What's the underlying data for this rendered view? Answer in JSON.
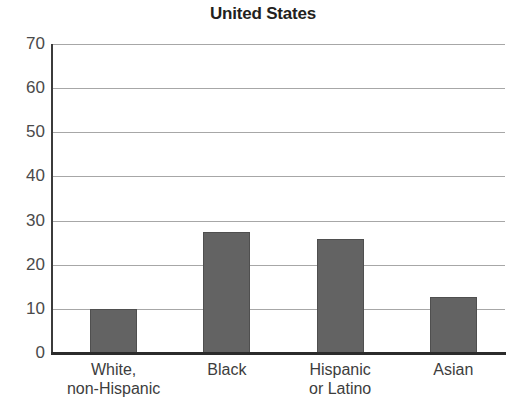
{
  "chart_data": {
    "type": "bar",
    "title": "United States",
    "xlabel": "",
    "ylabel": "",
    "categories": [
      "White,\nnon-Hispanic",
      "Black",
      "Hispanic\nor Latino",
      "Asian"
    ],
    "category_lines": [
      [
        "White,",
        "non-Hispanic"
      ],
      [
        "Black"
      ],
      [
        "Hispanic",
        "or Latino"
      ],
      [
        "Asian"
      ]
    ],
    "values": [
      10,
      27.5,
      25.8,
      12.7
    ],
    "ylim": [
      0,
      70
    ],
    "ytick_labels": [
      "70",
      "60",
      "50",
      "40",
      "30",
      "20",
      "10",
      "0"
    ],
    "yticks": [
      70,
      60,
      50,
      40,
      30,
      20,
      10,
      0
    ],
    "grid": true,
    "legend": "none",
    "bar_color": "#636363",
    "bar_edge_color": "#4f4f4f",
    "gridline_color": "#a7a7a7",
    "axis_color": "#2b2b2b",
    "title_color": "#231f20",
    "background": "#ffffff"
  }
}
